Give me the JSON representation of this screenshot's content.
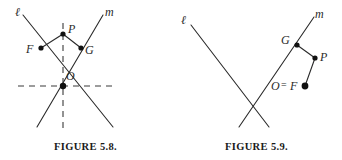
{
  "page": {
    "background_color": "#ffffff",
    "ink_color": "#2a2a2a",
    "width": 342,
    "height": 160
  },
  "figures": [
    {
      "id": "figure-5-8",
      "caption": "FIGURE 5.8.",
      "line_labels": {
        "line_l": "ℓ",
        "line_m": "m"
      },
      "points": [
        {
          "name": "P",
          "label": "P",
          "x": 63,
          "y": 34
        },
        {
          "name": "F",
          "label": "F",
          "x": 41,
          "y": 48
        },
        {
          "name": "G",
          "label": "G",
          "x": 81,
          "y": 48
        },
        {
          "name": "O",
          "label": "O",
          "x": 63,
          "y": 86
        }
      ],
      "solid_segments": [
        {
          "name": "line-l",
          "x1": 23,
          "y1": 15,
          "x2": 113,
          "y2": 127
        },
        {
          "name": "line-m",
          "x1": 103,
          "y1": 15,
          "x2": 37,
          "y2": 127
        },
        {
          "name": "segment-F-P",
          "x1": 41,
          "y1": 48,
          "x2": 63,
          "y2": 34
        },
        {
          "name": "segment-P-G",
          "x1": 63,
          "y1": 34,
          "x2": 81,
          "y2": 48
        }
      ],
      "dashed_segments": [
        {
          "name": "axis-vertical",
          "x1": 63,
          "y1": 23,
          "x2": 63,
          "y2": 130
        },
        {
          "name": "axis-horizontal",
          "x1": 18,
          "y1": 86,
          "x2": 113,
          "y2": 86
        }
      ]
    },
    {
      "id": "figure-5-9",
      "caption": "FIGURE 5.9.",
      "line_labels": {
        "line_l": "ℓ",
        "line_m": "m"
      },
      "points": [
        {
          "name": "G",
          "label": "G",
          "x": 126,
          "y": 45
        },
        {
          "name": "P",
          "label": "P",
          "x": 144,
          "y": 58
        },
        {
          "name": "O-equals-F",
          "label": "O",
          "label2": "F",
          "equals": "=",
          "x": 134,
          "y": 86
        }
      ],
      "solid_segments": [
        {
          "name": "line-l",
          "x1": 20,
          "y1": 25,
          "x2": 98,
          "y2": 127
        },
        {
          "name": "line-m",
          "x1": 143,
          "y1": 17,
          "x2": 68,
          "y2": 127
        },
        {
          "name": "segment-O-P",
          "x1": 134,
          "y1": 86,
          "x2": 144,
          "y2": 58
        },
        {
          "name": "segment-G-P",
          "x1": 126,
          "y1": 45,
          "x2": 144,
          "y2": 58
        }
      ],
      "dashed_segments": []
    }
  ]
}
